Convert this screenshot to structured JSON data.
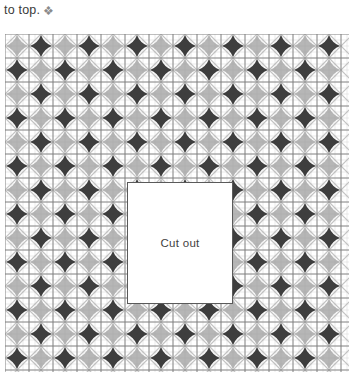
{
  "caption": {
    "text": "to top.",
    "glyph": "❖",
    "glyph_name": "diamond-flower-icon"
  },
  "cutout": {
    "label": "Cut out",
    "x": 122,
    "y": 148,
    "width": 106,
    "height": 122,
    "fill": "#ffffff",
    "border_color": "#5a5a5a"
  },
  "chart_data": {
    "type": "heatmap",
    "title": "",
    "subtitle": "",
    "xlabel": "",
    "ylabel": "",
    "grid": true,
    "legend": "none",
    "origin": {
      "x": 5,
      "y": 34
    },
    "plot_width": 344,
    "plot_height": 338,
    "minor_cell": 6,
    "major_cell": 24,
    "motif_spacing": 24,
    "motif_offset": {
      "x": 12,
      "y": 12
    },
    "cols": 14,
    "rows": 14,
    "categories": [
      "col1",
      "col2",
      "col3",
      "col4",
      "col5",
      "col6",
      "col7",
      "col8",
      "col9",
      "col10",
      "col11",
      "col12",
      "col13",
      "col14"
    ],
    "values": [
      [
        0,
        1,
        0,
        1,
        0,
        1,
        0,
        1,
        0,
        1,
        0,
        1,
        0,
        1
      ],
      [
        1,
        0,
        1,
        0,
        1,
        0,
        1,
        0,
        1,
        0,
        1,
        0,
        1,
        0
      ],
      [
        0,
        1,
        0,
        1,
        0,
        1,
        0,
        1,
        0,
        1,
        0,
        1,
        0,
        1
      ],
      [
        1,
        0,
        1,
        0,
        1,
        0,
        1,
        0,
        1,
        0,
        1,
        0,
        1,
        0
      ],
      [
        0,
        1,
        0,
        1,
        0,
        1,
        0,
        1,
        0,
        1,
        0,
        1,
        0,
        1
      ],
      [
        1,
        0,
        1,
        0,
        1,
        0,
        1,
        0,
        1,
        0,
        1,
        0,
        1,
        0
      ],
      [
        0,
        1,
        0,
        1,
        0,
        1,
        0,
        1,
        0,
        1,
        0,
        1,
        0,
        1
      ],
      [
        1,
        0,
        1,
        0,
        1,
        0,
        1,
        0,
        1,
        0,
        1,
        0,
        1,
        0
      ],
      [
        0,
        1,
        0,
        1,
        0,
        1,
        0,
        1,
        0,
        1,
        0,
        1,
        0,
        1
      ],
      [
        1,
        0,
        1,
        0,
        1,
        0,
        1,
        0,
        1,
        0,
        1,
        0,
        1,
        0
      ],
      [
        0,
        1,
        0,
        1,
        0,
        1,
        0,
        1,
        0,
        1,
        0,
        1,
        0,
        1
      ],
      [
        1,
        0,
        1,
        0,
        1,
        0,
        1,
        0,
        1,
        0,
        1,
        0,
        1,
        0
      ],
      [
        0,
        1,
        0,
        1,
        0,
        1,
        0,
        1,
        0,
        1,
        0,
        1,
        0,
        1
      ],
      [
        1,
        0,
        1,
        0,
        1,
        0,
        1,
        0,
        1,
        0,
        1,
        0,
        1,
        0
      ]
    ],
    "value_legend": [
      {
        "value": 0,
        "name": "light-star",
        "color": "#9a9a9a"
      },
      {
        "value": 1,
        "name": "dark-star",
        "color": "#2e2e2e"
      }
    ],
    "colors": {
      "minor_grid": "#d6d6d6",
      "major_grid": "#7d7d7d",
      "diagonal": "#b9b9b9",
      "dark_motif": "#2e2e2e",
      "light_motif": "#9a9a9a",
      "background": "#ffffff",
      "text": "#3a3a3a"
    }
  }
}
